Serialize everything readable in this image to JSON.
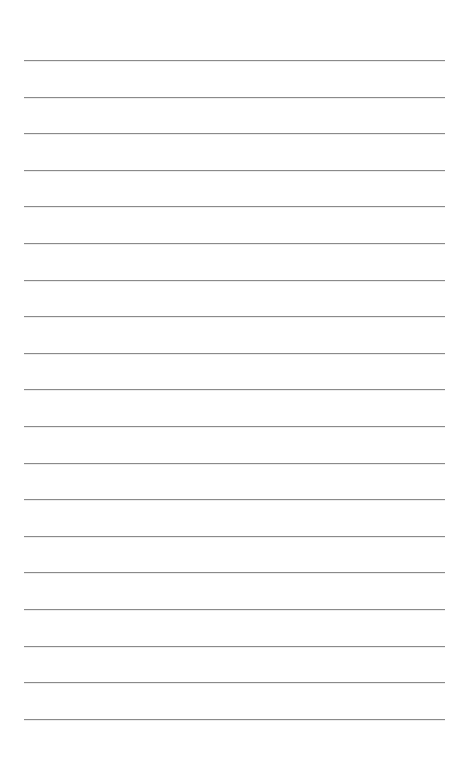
{
  "page": {
    "type": "blank lined paper",
    "background_color": "#ffffff",
    "line_color": "#8a8a8a",
    "line_count": 19,
    "first_line_y": 60,
    "line_spacing": 36.6,
    "line_left_x": 24,
    "line_right_x": 445
  }
}
